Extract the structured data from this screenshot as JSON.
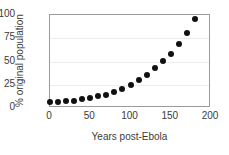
{
  "chart_data": {
    "type": "scatter",
    "title": "",
    "xlabel": "Years post-Ebola",
    "ylabel": "% original population",
    "xlim": [
      0,
      200
    ],
    "ylim": [
      0,
      100
    ],
    "xticks": [
      0,
      50,
      100,
      150,
      200
    ],
    "yticks": [
      0,
      25,
      50,
      75,
      100
    ],
    "xtick_labels": [
      "0",
      "50",
      "100",
      "150",
      "200"
    ],
    "ytick_labels": [
      "0",
      "25",
      "50",
      "75",
      "100"
    ],
    "grid": "horizontal",
    "legend": "none",
    "marker": "filled-circle",
    "marker_color": "#111111",
    "frame_color": "#9a9a9a",
    "gridline_color": "#ededed",
    "x": [
      0,
      10,
      20,
      30,
      40,
      50,
      60,
      70,
      80,
      90,
      100,
      110,
      120,
      130,
      140,
      150,
      160,
      170,
      180
    ],
    "values": [
      6,
      6.5,
      7,
      8,
      9.5,
      11,
      12.5,
      14.5,
      17,
      20,
      24.5,
      30.5,
      36,
      43.5,
      50.5,
      58.5,
      69,
      81,
      96
    ],
    "series": [
      {
        "name": "% original population",
        "x": [
          0,
          10,
          20,
          30,
          40,
          50,
          60,
          70,
          80,
          90,
          100,
          110,
          120,
          130,
          140,
          150,
          160,
          170,
          180
        ],
        "values": [
          6,
          6.5,
          7,
          8,
          9.5,
          11,
          12.5,
          14.5,
          17,
          20,
          24.5,
          30.5,
          36,
          43.5,
          50.5,
          58.5,
          69,
          81,
          96
        ]
      }
    ]
  }
}
